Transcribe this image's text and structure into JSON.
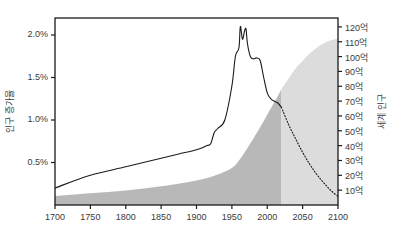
{
  "chart_data": {
    "type": "line",
    "title": "",
    "subtitle": "",
    "xlabel": "",
    "ylabel_left": "인구 증가율",
    "ylabel_right": "세계 인구",
    "grid": false,
    "legend_position": "none",
    "xlim": [
      1700,
      2100
    ],
    "xticks": [
      "1700",
      "1750",
      "1800",
      "1850",
      "1900",
      "1950",
      "2000",
      "2050",
      "2100"
    ],
    "xtick_values": [
      1700,
      1750,
      1800,
      1850,
      1900,
      1950,
      2000,
      2050,
      2100
    ],
    "left_axis": {
      "label": "인구 증가율",
      "ylim": [
        0,
        2.2
      ],
      "ticks": [
        "0.5%",
        "1.0%",
        "1.5%",
        "2.0%"
      ],
      "tick_values": [
        0.5,
        1.0,
        1.5,
        2.0
      ],
      "unit": "%"
    },
    "right_axis": {
      "label": "세계 인구",
      "ylim": [
        0,
        12.6
      ],
      "ticks": [
        "10억",
        "20억",
        "30억",
        "40억",
        "50억",
        "60억",
        "70억",
        "80억",
        "90억",
        "100억",
        "110억",
        "120억"
      ],
      "tick_values": [
        1,
        2,
        3,
        4,
        5,
        6,
        7,
        8,
        9,
        10,
        11,
        12
      ],
      "unit": "억"
    },
    "series": [
      {
        "name": "인구 증가율",
        "axis": "left",
        "style": "line",
        "color": "#1a1a1a",
        "x": [
          1700,
          1750,
          1800,
          1850,
          1875,
          1900,
          1915,
          1920,
          1925,
          1930,
          1940,
          1950,
          1955,
          1960,
          1962,
          1965,
          1968,
          1970,
          1972,
          1976,
          1980,
          1985,
          1990,
          1995,
          2000,
          2005,
          2010,
          2015,
          2020
        ],
        "values": [
          0.2,
          0.35,
          0.45,
          0.55,
          0.6,
          0.65,
          0.7,
          0.72,
          0.85,
          0.9,
          1.0,
          1.4,
          1.75,
          1.85,
          2.1,
          1.95,
          2.05,
          2.07,
          1.9,
          1.75,
          1.72,
          1.73,
          1.7,
          1.5,
          1.32,
          1.25,
          1.22,
          1.2,
          1.15
        ]
      },
      {
        "name": "세계 인구 (실측)",
        "axis": "right",
        "style": "area",
        "color": "#b8b8b8",
        "x": [
          1700,
          1750,
          1800,
          1850,
          1900,
          1927,
          1950,
          1960,
          1974,
          1987,
          1999,
          2011,
          2020
        ],
        "values": [
          0.6,
          0.79,
          0.98,
          1.26,
          1.65,
          2.0,
          2.5,
          3.0,
          4.0,
          5.0,
          6.0,
          7.0,
          7.8
        ]
      },
      {
        "name": "세계 인구 (전망)",
        "axis": "right",
        "style": "area",
        "color": "#dcdcdc",
        "x": [
          2020,
          2030,
          2040,
          2050,
          2060,
          2070,
          2080,
          2090,
          2100
        ],
        "values": [
          7.8,
          8.5,
          9.2,
          9.7,
          10.2,
          10.6,
          10.9,
          11.1,
          11.2
        ]
      },
      {
        "name": "인구 증가율 (전망)",
        "axis": "left",
        "style": "dotted",
        "color": "#1a1a1a",
        "x": [
          2020,
          2030,
          2040,
          2050,
          2060,
          2070,
          2080,
          2090,
          2100
        ],
        "values": [
          1.15,
          0.95,
          0.78,
          0.62,
          0.48,
          0.36,
          0.26,
          0.17,
          0.1
        ]
      }
    ],
    "colors": {
      "axis": "#1a1a1a",
      "text": "#3a3a3a",
      "population_historic": "#b8b8b8",
      "population_projected": "#dcdcdc",
      "growth_line": "#1a1a1a",
      "background": "#ffffff"
    }
  }
}
